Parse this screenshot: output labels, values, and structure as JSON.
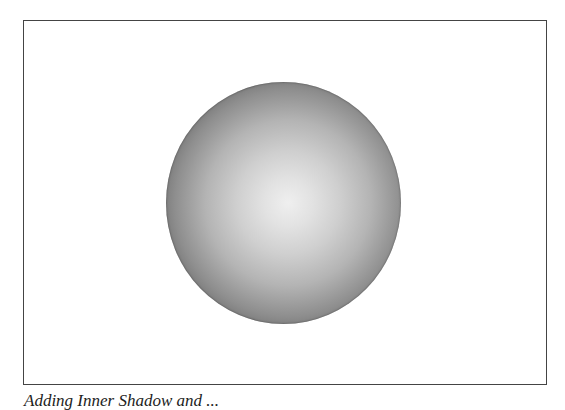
{
  "figure": {
    "shape": "sphere",
    "shading": "radial gradient, light center to dark edge",
    "colors": {
      "highlight": "#efefef",
      "mid": "#b4b4b4",
      "edge": "#3a3a3a",
      "frame": "#444444"
    }
  },
  "caption": {
    "text": "Adding Inner Shadow and ..."
  }
}
